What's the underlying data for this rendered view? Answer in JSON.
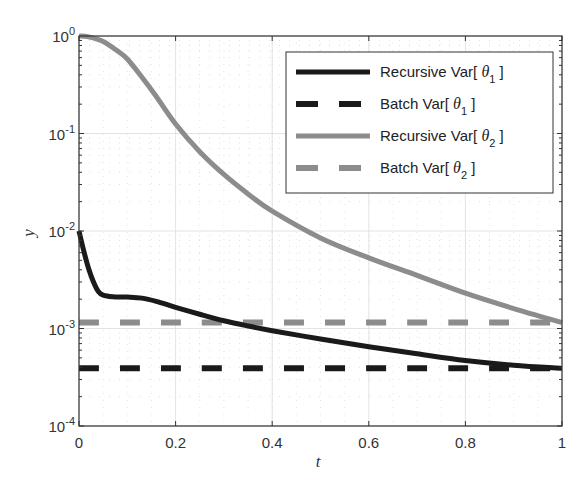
{
  "chart_data": {
    "type": "line",
    "title": "",
    "xlabel": "t",
    "ylabel": "y",
    "xlim": [
      0,
      1
    ],
    "ylim": [
      0.0001,
      1
    ],
    "yscale": "log",
    "grid": true,
    "minor_grid": true,
    "legend_position": "upper right",
    "x_ticks": [
      0,
      0.2,
      0.4,
      0.6,
      0.8,
      1
    ],
    "x_tick_labels": [
      "0",
      "0.2",
      "0.4",
      "0.6",
      "0.8",
      "1"
    ],
    "y_ticks": [
      1,
      0.1,
      0.01,
      0.001,
      0.0001
    ],
    "y_tick_labels": [
      {
        "base": "10",
        "exp": "0"
      },
      {
        "base": "10",
        "exp": "-1"
      },
      {
        "base": "10",
        "exp": "-2"
      },
      {
        "base": "10",
        "exp": "-3"
      },
      {
        "base": "10",
        "exp": "-4"
      }
    ],
    "series": [
      {
        "name": "Recursive Var[ θ1 ]",
        "legend_main": "Recursive Var[ θ",
        "legend_sub": "1",
        "legend_close": " ]",
        "color": "#1a1a1a",
        "style": "solid",
        "x": [
          0,
          0.01,
          0.02,
          0.03,
          0.04,
          0.05,
          0.07,
          0.1,
          0.13,
          0.16,
          0.2,
          0.25,
          0.3,
          0.35,
          0.4,
          0.5,
          0.6,
          0.7,
          0.8,
          0.9,
          1.0
        ],
        "values": [
          0.01,
          0.0062,
          0.0041,
          0.003,
          0.0024,
          0.0022,
          0.00212,
          0.0021,
          0.00205,
          0.0019,
          0.00165,
          0.0014,
          0.0012,
          0.00106,
          0.00095,
          0.00078,
          0.00065,
          0.00055,
          0.00047,
          0.00042,
          0.00039
        ]
      },
      {
        "name": "Batch Var[ θ1 ]",
        "legend_main": "Batch Var[ θ",
        "legend_sub": "1",
        "legend_close": " ]",
        "color": "#1a1a1a",
        "style": "dashed",
        "x": [
          0,
          1
        ],
        "values": [
          0.00039,
          0.00039
        ]
      },
      {
        "name": "Recursive Var[ θ2 ]",
        "legend_main": "Recursive Var[ θ",
        "legend_sub": "2",
        "legend_close": " ]",
        "color": "#8c8c8c",
        "style": "solid",
        "x": [
          0,
          0.02,
          0.05,
          0.08,
          0.1,
          0.13,
          0.16,
          0.2,
          0.25,
          0.3,
          0.35,
          0.4,
          0.5,
          0.6,
          0.7,
          0.8,
          0.9,
          1.0
        ],
        "values": [
          1.0,
          0.98,
          0.88,
          0.7,
          0.58,
          0.38,
          0.24,
          0.125,
          0.065,
          0.038,
          0.024,
          0.016,
          0.0085,
          0.0053,
          0.0035,
          0.0023,
          0.0016,
          0.00115
        ]
      },
      {
        "name": "Batch Var[ θ2 ]",
        "legend_main": "Batch Var[ θ",
        "legend_sub": "2",
        "legend_close": " ]",
        "color": "#8c8c8c",
        "style": "dashed",
        "x": [
          0,
          1
        ],
        "values": [
          0.00115,
          0.00115
        ]
      }
    ]
  }
}
